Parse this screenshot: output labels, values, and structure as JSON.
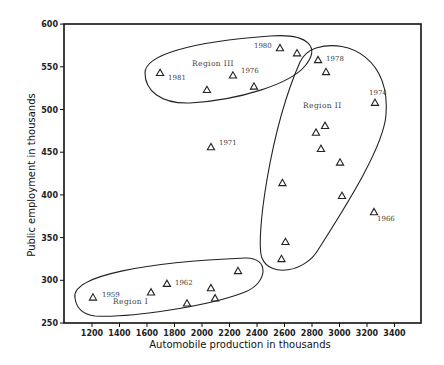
{
  "chart_data": {
    "type": "scatter",
    "title": "",
    "xlabel": "Automobile production in thousands",
    "ylabel": "Public employment in thousands",
    "xlim": [
      1000,
      3560
    ],
    "ylim": [
      250,
      600
    ],
    "x_ticks": [
      1200,
      1400,
      1600,
      1800,
      2000,
      2200,
      2400,
      2600,
      2800,
      3000,
      3200,
      3400
    ],
    "y_ticks": [
      250,
      300,
      350,
      400,
      450,
      500,
      550,
      600
    ],
    "grid": false,
    "marker": "open-triangle",
    "points": [
      {
        "x": 1207,
        "y": 280,
        "label": "1959",
        "group": "Region I"
      },
      {
        "x": 1629,
        "y": 286,
        "label": "",
        "group": "Region I"
      },
      {
        "x": 1745,
        "y": 296,
        "label": "1962",
        "group": "Region I"
      },
      {
        "x": 1891,
        "y": 273,
        "label": "",
        "group": "Region I"
      },
      {
        "x": 2065,
        "y": 291,
        "label": "",
        "group": "Region I"
      },
      {
        "x": 2095,
        "y": 279,
        "label": "",
        "group": "Region I"
      },
      {
        "x": 2262,
        "y": 311,
        "label": "",
        "group": "Region I"
      },
      {
        "x": 1695,
        "y": 543,
        "label": "1981",
        "group": "Region III"
      },
      {
        "x": 2036,
        "y": 523,
        "label": "",
        "group": "Region III"
      },
      {
        "x": 2225,
        "y": 540,
        "label": "1976",
        "group": "Region III"
      },
      {
        "x": 2378,
        "y": 527,
        "label": "",
        "group": "Region III"
      },
      {
        "x": 2567,
        "y": 572,
        "label": "1980",
        "group": "Region III"
      },
      {
        "x": 2691,
        "y": 566,
        "label": "",
        "group": "Region III"
      },
      {
        "x": 2065,
        "y": 456,
        "label": "1971",
        "group": "none"
      },
      {
        "x": 2844,
        "y": 558,
        "label": "1978",
        "group": "Region II"
      },
      {
        "x": 2902,
        "y": 544,
        "label": "",
        "group": "Region II"
      },
      {
        "x": 3258,
        "y": 508,
        "label": "1974",
        "group": "Region II"
      },
      {
        "x": 2895,
        "y": 481,
        "label": "",
        "group": "Region II"
      },
      {
        "x": 2829,
        "y": 473,
        "label": "",
        "group": "Region II"
      },
      {
        "x": 2865,
        "y": 454,
        "label": "",
        "group": "Region II"
      },
      {
        "x": 3004,
        "y": 438,
        "label": "",
        "group": "Region II"
      },
      {
        "x": 2585,
        "y": 414,
        "label": "",
        "group": "Region II"
      },
      {
        "x": 3018,
        "y": 399,
        "label": "",
        "group": "Region II"
      },
      {
        "x": 3251,
        "y": 380,
        "label": "1966",
        "group": "none"
      },
      {
        "x": 2607,
        "y": 345,
        "label": "",
        "group": "Region II"
      },
      {
        "x": 2578,
        "y": 325,
        "label": "",
        "group": "Region II"
      }
    ],
    "regions": [
      {
        "name": "Region I",
        "label": "Region I"
      },
      {
        "name": "Region II",
        "label": "Region II"
      },
      {
        "name": "Region III",
        "label": "Region III"
      }
    ],
    "legend": "none"
  }
}
